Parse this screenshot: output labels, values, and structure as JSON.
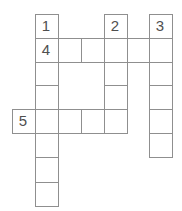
{
  "puzzle": {
    "kind": "crossword-grid",
    "numbers": [
      {
        "label": "1",
        "row": 0,
        "col": 1
      },
      {
        "label": "2",
        "row": 0,
        "col": 4
      },
      {
        "label": "3",
        "row": 0,
        "col": 6
      },
      {
        "label": "4",
        "row": 1,
        "col": 1
      },
      {
        "label": "5",
        "row": 4,
        "col": 0
      }
    ],
    "cells": [
      {
        "row": 0,
        "col": 1,
        "number": "1"
      },
      {
        "row": 0,
        "col": 4,
        "number": "2"
      },
      {
        "row": 0,
        "col": 6,
        "number": "3"
      },
      {
        "row": 1,
        "col": 1,
        "number": "4"
      },
      {
        "row": 1,
        "col": 2
      },
      {
        "row": 1,
        "col": 3
      },
      {
        "row": 1,
        "col": 4
      },
      {
        "row": 1,
        "col": 5
      },
      {
        "row": 1,
        "col": 6
      },
      {
        "row": 2,
        "col": 1
      },
      {
        "row": 2,
        "col": 4
      },
      {
        "row": 2,
        "col": 6
      },
      {
        "row": 3,
        "col": 1
      },
      {
        "row": 3,
        "col": 4
      },
      {
        "row": 3,
        "col": 6
      },
      {
        "row": 4,
        "col": 0,
        "number": "5"
      },
      {
        "row": 4,
        "col": 1
      },
      {
        "row": 4,
        "col": 2
      },
      {
        "row": 4,
        "col": 3
      },
      {
        "row": 4,
        "col": 4
      },
      {
        "row": 4,
        "col": 6
      },
      {
        "row": 5,
        "col": 1
      },
      {
        "row": 5,
        "col": 6
      },
      {
        "row": 6,
        "col": 1
      },
      {
        "row": 7,
        "col": 1
      }
    ],
    "col_edges": [
      12,
      35,
      58,
      81,
      104,
      127,
      149,
      172
    ],
    "row_edges": [
      14,
      38,
      62,
      85,
      109,
      133,
      157,
      182,
      206
    ],
    "colors": {
      "grid_line": "#8f8f8f",
      "cell_background": "#ffffff",
      "page_background": "#ffffff",
      "number_text": "#4f4f4f"
    }
  }
}
